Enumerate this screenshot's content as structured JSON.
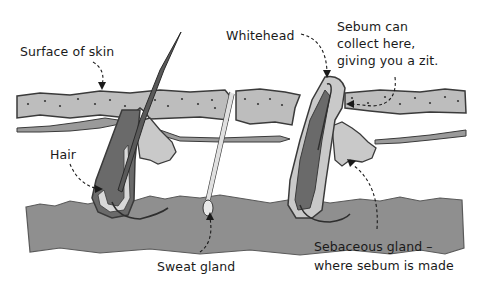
{
  "diagram": {
    "colors": {
      "epidermis": "#bdbdbd",
      "dermis_base": "#8f8f8f",
      "follicle_light": "#c9c9c9",
      "follicle_dark": "#6a6a6a",
      "outline": "#3a3a3a",
      "background": "#ffffff"
    },
    "labels": {
      "surface_of_skin": "Surface of skin",
      "whitehead": "Whitehead",
      "sebum_line1": "Sebum can",
      "sebum_line2": "collect here,",
      "sebum_line3": "giving you a zit.",
      "hair": "Hair",
      "sweat_gland": "Sweat gland",
      "sebaceous_line1": "Sebaceous gland –",
      "sebaceous_line2": "where sebum is made"
    }
  }
}
